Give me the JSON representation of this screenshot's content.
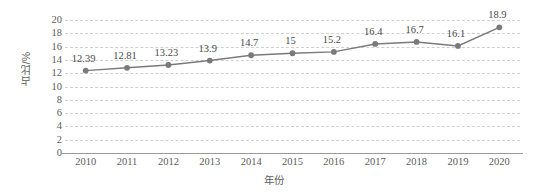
{
  "chart_data": {
    "type": "line",
    "title": "",
    "xlabel": "年份",
    "ylabel": "占比/%",
    "categories": [
      "2010",
      "2011",
      "2012",
      "2013",
      "2014",
      "2015",
      "2016",
      "2017",
      "2018",
      "2019",
      "2020"
    ],
    "values": [
      12.39,
      12.81,
      13.23,
      13.9,
      14.7,
      15,
      15.2,
      16.4,
      16.7,
      16.1,
      18.9
    ],
    "data_labels": [
      "12.39",
      "12.81",
      "13.23",
      "13.9",
      "14.7",
      "15",
      "15.2",
      "16.4",
      "16.7",
      "16.1",
      "18.9"
    ],
    "ylim": [
      0,
      20
    ],
    "ytick_step": 2,
    "yticks": [
      "20",
      "18",
      "16",
      "14",
      "12",
      "10",
      "8",
      "6",
      "4",
      "2",
      "0"
    ],
    "ytick_values": [
      20,
      18,
      16,
      14,
      12,
      10,
      8,
      6,
      4,
      2,
      0
    ],
    "grid": true,
    "grid_style": "dashed",
    "legend": "none",
    "series_color": "#7a7a7a",
    "marker": "circle",
    "grid_color": "#cfcfcf",
    "axis_color": "#9a9a9a",
    "text_color": "#5c5c5c",
    "background": "#ffffff"
  }
}
